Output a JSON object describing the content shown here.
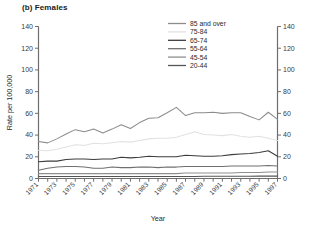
{
  "figure": {
    "title": "(b) Females"
  },
  "chart_data": {
    "type": "line",
    "title": "(b) Females",
    "xlabel": "Year",
    "ylabel": "Rate per 100,000",
    "xlim": [
      1971,
      1997
    ],
    "ylim": [
      0,
      140
    ],
    "ytick_values": [
      0,
      20,
      40,
      60,
      80,
      100,
      120,
      140
    ],
    "ytick_labels": [
      "0",
      "20",
      "40",
      "60",
      "80",
      "100",
      "120",
      "140"
    ],
    "right_axis": {
      "visible": true,
      "ylim": [
        0,
        140
      ],
      "ytick_values": [
        0,
        20,
        40,
        60,
        80,
        100,
        120,
        140
      ],
      "ytick_labels": [
        "0",
        "20",
        "40",
        "60",
        "80",
        "100",
        "120",
        "140"
      ]
    },
    "grid": false,
    "legend_position": "top-center",
    "x": [
      1971,
      1972,
      1973,
      1974,
      1975,
      1976,
      1977,
      1978,
      1979,
      1980,
      1981,
      1982,
      1983,
      1984,
      1985,
      1986,
      1987,
      1988,
      1989,
      1990,
      1991,
      1992,
      1993,
      1994,
      1995,
      1996,
      1997
    ],
    "xtick_values": [
      1971,
      1973,
      1975,
      1977,
      1979,
      1981,
      1983,
      1985,
      1987,
      1989,
      1991,
      1993,
      1995,
      1997
    ],
    "xtick_labels": [
      "1971",
      "1973",
      "1975",
      "1977",
      "1979",
      "1981",
      "1983",
      "1985",
      "1987",
      "1989",
      "1991",
      "1993",
      "1995",
      "1997"
    ],
    "series": [
      {
        "name": "85 and over",
        "color": "#8c8c8c",
        "values": [
          34.0,
          32.8,
          36.5,
          41.0,
          45.0,
          43.0,
          45.5,
          42.0,
          45.5,
          49.5,
          46.0,
          51.5,
          55.5,
          56.0,
          60.5,
          65.5,
          58.0,
          60.5,
          60.5,
          61.0,
          60.0,
          60.5,
          60.5,
          57.0,
          54.0,
          61.0,
          54.5
        ]
      },
      {
        "name": "75-84",
        "color": "#e2e2e2",
        "values": [
          26.0,
          25.5,
          27.0,
          29.0,
          31.0,
          30.5,
          32.5,
          32.0,
          33.0,
          34.0,
          33.5,
          35.0,
          36.5,
          37.0,
          37.0,
          38.0,
          40.5,
          43.0,
          40.5,
          40.0,
          39.5,
          40.5,
          39.0,
          38.0,
          39.0,
          37.0,
          35.0
        ]
      },
      {
        "name": "65-74",
        "color": "#3c3c3c",
        "values": [
          15.5,
          16.0,
          16.0,
          17.5,
          18.0,
          18.0,
          17.5,
          18.0,
          18.0,
          19.5,
          19.0,
          19.5,
          20.5,
          20.0,
          20.0,
          20.0,
          21.5,
          21.0,
          20.5,
          20.5,
          21.0,
          22.0,
          22.5,
          23.0,
          24.0,
          25.5,
          20.5
        ]
      },
      {
        "name": "55-64",
        "color": "#6f6f6f",
        "values": [
          7.5,
          9.5,
          10.5,
          11.0,
          11.0,
          10.5,
          9.5,
          9.5,
          10.5,
          10.0,
          10.0,
          10.5,
          10.5,
          10.0,
          10.5,
          10.5,
          11.0,
          11.0,
          11.0,
          11.0,
          11.0,
          11.5,
          11.5,
          11.5,
          11.5,
          12.0,
          11.5
        ]
      },
      {
        "name": "45-54",
        "color": "#8f8f8f",
        "values": [
          4.5,
          4.5,
          4.5,
          4.5,
          4.5,
          4.5,
          4.5,
          4.5,
          4.5,
          4.5,
          4.5,
          4.5,
          4.5,
          4.5,
          4.5,
          4.5,
          5.0,
          5.0,
          5.0,
          5.0,
          5.0,
          5.0,
          5.5,
          5.5,
          5.5,
          6.0,
          6.0
        ]
      },
      {
        "name": "20-44",
        "color": "#555555",
        "values": [
          1.8,
          1.8,
          1.8,
          1.8,
          1.8,
          1.8,
          1.8,
          1.8,
          1.8,
          1.8,
          1.8,
          1.8,
          1.8,
          1.8,
          1.8,
          1.8,
          1.8,
          1.8,
          2.0,
          2.0,
          2.0,
          2.0,
          2.0,
          2.0,
          2.2,
          2.2,
          2.2
        ]
      }
    ]
  }
}
